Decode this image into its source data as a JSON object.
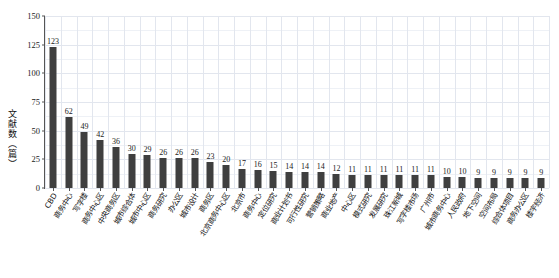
{
  "chart_data": {
    "type": "bar",
    "title": "",
    "subtitle": "",
    "xlabel": "",
    "ylabel": "文献数（篇）",
    "ylim": [
      0,
      150
    ],
    "yticks": [
      0,
      25,
      50,
      75,
      100,
      125,
      150
    ],
    "ytick_labels": [
      "0",
      "25",
      "50",
      "75",
      "100",
      "125",
      "150"
    ],
    "grid": true,
    "legend": "none",
    "bar_color": "#3f3f3f",
    "show_value_labels": true,
    "categories": [
      "CBD",
      "商务中心",
      "写字楼",
      "商务中心区",
      "中央商务区",
      "城市综合体",
      "城市中心区",
      "商务研究",
      "办公区",
      "城市设计",
      "商务区",
      "北京商务中心区",
      "北京市",
      "商务中心",
      "定位研究",
      "商业计划书",
      "可行性研究",
      "营销策略",
      "商业地产",
      "中心区",
      "模式研究",
      "发展研究",
      "珠江新城",
      "写字楼市场",
      "广州市",
      "城市商务中心",
      "人民政府",
      "地下空间",
      "空间布局",
      "综合体项目",
      "商务办公区",
      "楼宇经济"
    ],
    "values": [
      123,
      62,
      49,
      42,
      36,
      30,
      29,
      26,
      26,
      26,
      23,
      20,
      17,
      16,
      15,
      14,
      14,
      14,
      12,
      11,
      11,
      11,
      11,
      11,
      11,
      10,
      10,
      9,
      9,
      9,
      9,
      9
    ]
  }
}
